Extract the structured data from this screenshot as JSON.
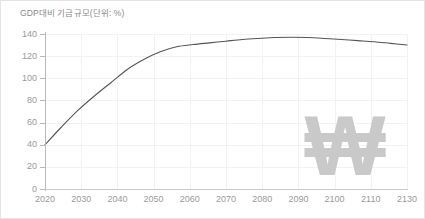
{
  "chart_data": {
    "type": "line",
    "title": "GDP대비 기금규모(단위: %)",
    "xlabel": "",
    "ylabel": "",
    "ylim": [
      0,
      140
    ],
    "xlim": [
      2020,
      2130
    ],
    "grid": true,
    "legend": false,
    "y_ticks": [
      0,
      20,
      40,
      60,
      80,
      100,
      120,
      140
    ],
    "y_tick_labels": [
      "0",
      "20",
      "40",
      "60",
      "80",
      "100",
      "120",
      "140"
    ],
    "x_tick_labels": [
      "2020",
      "2030",
      "2040",
      "2050",
      "2060",
      "2070",
      "2080",
      "2090",
      "2100",
      "2110",
      "2130"
    ],
    "x": [
      2020,
      2025,
      2030,
      2035,
      2040,
      2045,
      2050,
      2055,
      2060,
      2065,
      2070,
      2075,
      2080,
      2085,
      2090,
      2095,
      2100,
      2105,
      2110,
      2115,
      2120,
      2125,
      2130
    ],
    "series": [
      {
        "name": "GDP대비 기금규모",
        "color": "#555555",
        "values": [
          40,
          56,
          71,
          84,
          96,
          108,
          117,
          124,
          128.5,
          130.5,
          132,
          133.5,
          135,
          136,
          136.8,
          137,
          136.8,
          136,
          135,
          134,
          133,
          131.5,
          130
        ]
      }
    ],
    "watermark": {
      "symbol": "₩",
      "name": "won-currency-watermark",
      "color": "#c9c9c9"
    },
    "colors": {
      "line": "#555555",
      "grid": "#f2f2f2",
      "axis": "#bbbbbb",
      "tick_label": "#9a9a9a",
      "title": "#8a8a8a",
      "background": "#ffffff",
      "border": "#e3e3e3"
    }
  }
}
